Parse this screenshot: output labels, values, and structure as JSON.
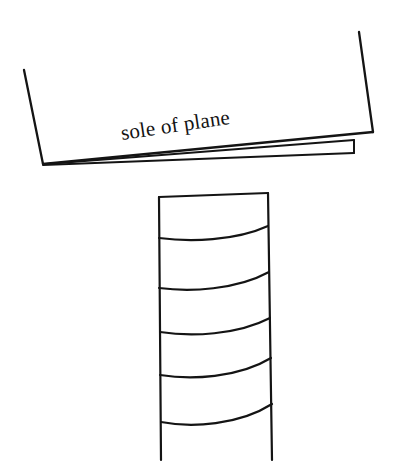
{
  "figure": {
    "name": "sole-of-plane-diagram",
    "title": "sole of plane",
    "background_color": "#ffffff",
    "ink_color": "#141414",
    "width": 405,
    "height": 473,
    "labels": {
      "sole_of_plane": "sole of plane"
    },
    "parts": {
      "plane_body_label": "plane body",
      "plane_sole_label": "plane sole",
      "shavings_stack_label": "stack of shavings"
    },
    "geometry": {
      "plane_body_left_edge": "M24,70 L43,164",
      "plane_body_bottom_edge": "M43,164 L373,132",
      "plane_body_right_edge": "M373,132 L359,32",
      "sole_strip_top": "M46,164 L354,140",
      "sole_strip_bottom": "M43,165 L354,153",
      "sole_strip_cap": "M354,140 L354,153",
      "stack_left_side": "M159,197 L161,460",
      "stack_right_side": "M268,193 L272,460",
      "stack_top_edge": "M159,197 L268,193",
      "stack_curve_1": "M159,238 C190,242 235,241 268,226",
      "stack_curve_2": "M159,288 C190,292 236,290 269,272",
      "stack_curve_3": "M160,332 C191,337 237,335 270,318",
      "stack_curve_4": "M160,375 C191,380 238,378 271,358",
      "stack_curve_5": "M161,422 C192,428 239,425 272,404"
    },
    "label_transform": {
      "x": 122,
      "y": 140,
      "rotation_degrees": -8.5
    },
    "shaving_count": 6
  }
}
